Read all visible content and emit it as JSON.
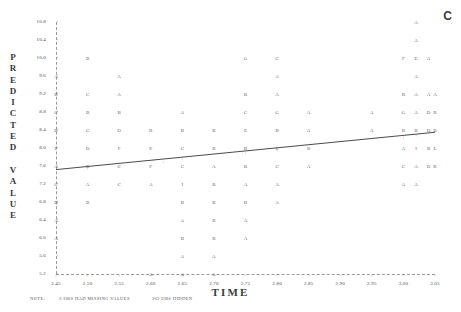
{
  "corner": {
    "label": "C"
  },
  "axes": {
    "y_title": "PREDICTED VALUE",
    "x_title": "TIME",
    "y_ticks": [
      "10.8",
      "10.4",
      "10.0",
      "9.6",
      "9.2",
      "8.8",
      "8.4",
      "8.0",
      "7.6",
      "7.2",
      "6.8",
      "6.4",
      "6.0",
      "5.6",
      "5.2"
    ],
    "x_ticks": [
      "2.45",
      "2.50",
      "2.55",
      "2.60",
      "2.65",
      "2.70",
      "2.75",
      "2.80",
      "2.85",
      "2.90",
      "2.95",
      "3.00",
      "3.05"
    ],
    "tick_mark": "+"
  },
  "note": {
    "label": "NOTE:",
    "text1": "6 OBS HAD MISSING VALUES",
    "text2": "363 OBS HIDDEN"
  },
  "chart_data": {
    "type": "scatter",
    "title": "",
    "xlabel": "TIME",
    "ylabel": "PREDICTED VALUE",
    "xlim": [
      2.45,
      3.05
    ],
    "ylim": [
      5.2,
      10.8
    ],
    "grid": false,
    "legend": "none",
    "marker_note": "letters A-F encode overplotted observation counts (A=1, B=2, C=3, D=4, E=5, F=6)",
    "points": [
      {
        "x": 2.5,
        "y": 10.0,
        "label": "B"
      },
      {
        "x": 2.45,
        "y": 9.6,
        "label": "A"
      },
      {
        "x": 2.55,
        "y": 9.6,
        "label": "A"
      },
      {
        "x": 2.45,
        "y": 9.2,
        "label": "B"
      },
      {
        "x": 2.5,
        "y": 9.2,
        "label": "C"
      },
      {
        "x": 2.55,
        "y": 9.2,
        "label": "A"
      },
      {
        "x": 2.45,
        "y": 8.8,
        "label": "C"
      },
      {
        "x": 2.5,
        "y": 8.8,
        "label": "B"
      },
      {
        "x": 2.55,
        "y": 8.8,
        "label": "B"
      },
      {
        "x": 2.45,
        "y": 8.4,
        "label": "B"
      },
      {
        "x": 2.5,
        "y": 8.4,
        "label": "C"
      },
      {
        "x": 2.55,
        "y": 8.4,
        "label": "D"
      },
      {
        "x": 2.45,
        "y": 8.0,
        "label": "F"
      },
      {
        "x": 2.5,
        "y": 8.0,
        "label": "D"
      },
      {
        "x": 2.55,
        "y": 8.0,
        "label": "F"
      },
      {
        "x": 2.45,
        "y": 7.6,
        "label": "A"
      },
      {
        "x": 2.5,
        "y": 7.6,
        "label": "B"
      },
      {
        "x": 2.55,
        "y": 7.6,
        "label": "C"
      },
      {
        "x": 2.45,
        "y": 7.2,
        "label": "C"
      },
      {
        "x": 2.5,
        "y": 7.2,
        "label": "A"
      },
      {
        "x": 2.55,
        "y": 7.2,
        "label": "C"
      },
      {
        "x": 2.45,
        "y": 6.8,
        "label": "D"
      },
      {
        "x": 2.5,
        "y": 6.8,
        "label": "B"
      },
      {
        "x": 2.45,
        "y": 6.4,
        "label": "A"
      },
      {
        "x": 2.45,
        "y": 6.0,
        "label": "A"
      },
      {
        "x": 2.6,
        "y": 8.4,
        "label": "B"
      },
      {
        "x": 2.65,
        "y": 8.4,
        "label": "B"
      },
      {
        "x": 2.7,
        "y": 8.4,
        "label": "B"
      },
      {
        "x": 2.65,
        "y": 8.8,
        "label": "A"
      },
      {
        "x": 2.6,
        "y": 8.0,
        "label": "E"
      },
      {
        "x": 2.65,
        "y": 8.0,
        "label": "C"
      },
      {
        "x": 2.7,
        "y": 8.0,
        "label": "B"
      },
      {
        "x": 2.6,
        "y": 7.6,
        "label": "F"
      },
      {
        "x": 2.65,
        "y": 7.6,
        "label": "C"
      },
      {
        "x": 2.7,
        "y": 7.6,
        "label": "A"
      },
      {
        "x": 2.6,
        "y": 7.2,
        "label": "A"
      },
      {
        "x": 2.65,
        "y": 7.2,
        "label": "I"
      },
      {
        "x": 2.7,
        "y": 7.2,
        "label": "B"
      },
      {
        "x": 2.65,
        "y": 6.8,
        "label": "B"
      },
      {
        "x": 2.7,
        "y": 6.8,
        "label": "B"
      },
      {
        "x": 2.65,
        "y": 6.4,
        "label": "A"
      },
      {
        "x": 2.7,
        "y": 6.4,
        "label": "B"
      },
      {
        "x": 2.65,
        "y": 6.0,
        "label": "B"
      },
      {
        "x": 2.7,
        "y": 6.0,
        "label": "B"
      },
      {
        "x": 2.65,
        "y": 5.6,
        "label": "A"
      },
      {
        "x": 2.7,
        "y": 5.6,
        "label": "A"
      },
      {
        "x": 2.6,
        "y": 5.2,
        "label": "A"
      },
      {
        "x": 2.65,
        "y": 5.2,
        "label": "A"
      },
      {
        "x": 2.7,
        "y": 5.2,
        "label": "A"
      },
      {
        "x": 2.75,
        "y": 10.0,
        "label": "G"
      },
      {
        "x": 2.75,
        "y": 9.2,
        "label": "B"
      },
      {
        "x": 2.75,
        "y": 8.8,
        "label": "C"
      },
      {
        "x": 2.75,
        "y": 8.4,
        "label": "E"
      },
      {
        "x": 2.75,
        "y": 8.0,
        "label": "B"
      },
      {
        "x": 2.75,
        "y": 7.6,
        "label": "B"
      },
      {
        "x": 2.75,
        "y": 7.2,
        "label": "A"
      },
      {
        "x": 2.75,
        "y": 6.8,
        "label": "B"
      },
      {
        "x": 2.75,
        "y": 6.4,
        "label": "A"
      },
      {
        "x": 2.75,
        "y": 6.0,
        "label": "A"
      },
      {
        "x": 2.8,
        "y": 10.0,
        "label": "C"
      },
      {
        "x": 2.8,
        "y": 9.6,
        "label": "A"
      },
      {
        "x": 2.8,
        "y": 9.2,
        "label": "A"
      },
      {
        "x": 2.8,
        "y": 8.8,
        "label": "G"
      },
      {
        "x": 2.8,
        "y": 8.4,
        "label": "B"
      },
      {
        "x": 2.8,
        "y": 8.0,
        "label": "E"
      },
      {
        "x": 2.8,
        "y": 7.6,
        "label": "C"
      },
      {
        "x": 2.8,
        "y": 7.2,
        "label": "A"
      },
      {
        "x": 2.8,
        "y": 6.8,
        "label": "A"
      },
      {
        "x": 2.85,
        "y": 8.8,
        "label": "A"
      },
      {
        "x": 2.85,
        "y": 8.4,
        "label": "A"
      },
      {
        "x": 2.85,
        "y": 8.0,
        "label": "B"
      },
      {
        "x": 2.85,
        "y": 7.6,
        "label": "A"
      },
      {
        "x": 2.95,
        "y": 8.8,
        "label": "A"
      },
      {
        "x": 2.95,
        "y": 8.4,
        "label": "A"
      },
      {
        "x": 3.0,
        "y": 10.0,
        "label": "F"
      },
      {
        "x": 3.0,
        "y": 9.2,
        "label": "B"
      },
      {
        "x": 3.0,
        "y": 8.8,
        "label": "G"
      },
      {
        "x": 3.0,
        "y": 8.4,
        "label": "B"
      },
      {
        "x": 3.0,
        "y": 8.0,
        "label": "A"
      },
      {
        "x": 3.0,
        "y": 7.6,
        "label": "C"
      },
      {
        "x": 3.0,
        "y": 7.2,
        "label": "A"
      },
      {
        "x": 3.02,
        "y": 10.8,
        "label": "A"
      },
      {
        "x": 3.02,
        "y": 10.4,
        "label": "A"
      },
      {
        "x": 3.02,
        "y": 10.0,
        "label": "E"
      },
      {
        "x": 3.02,
        "y": 9.6,
        "label": "A"
      },
      {
        "x": 3.02,
        "y": 9.2,
        "label": "A"
      },
      {
        "x": 3.02,
        "y": 8.8,
        "label": "A"
      },
      {
        "x": 3.02,
        "y": 8.4,
        "label": "B"
      },
      {
        "x": 3.02,
        "y": 8.0,
        "label": "I"
      },
      {
        "x": 3.02,
        "y": 7.6,
        "label": "A"
      },
      {
        "x": 3.02,
        "y": 7.2,
        "label": "A"
      },
      {
        "x": 3.04,
        "y": 10.0,
        "label": "A"
      },
      {
        "x": 3.04,
        "y": 9.2,
        "label": "A"
      },
      {
        "x": 3.04,
        "y": 8.8,
        "label": "D"
      },
      {
        "x": 3.04,
        "y": 8.4,
        "label": "D"
      },
      {
        "x": 3.04,
        "y": 8.0,
        "label": "B"
      },
      {
        "x": 3.04,
        "y": 7.6,
        "label": "D"
      },
      {
        "x": 3.05,
        "y": 9.2,
        "label": "A"
      },
      {
        "x": 3.05,
        "y": 8.8,
        "label": "B"
      },
      {
        "x": 3.05,
        "y": 8.4,
        "label": "B"
      },
      {
        "x": 3.05,
        "y": 8.0,
        "label": "L"
      },
      {
        "x": 3.05,
        "y": 7.6,
        "label": "B"
      }
    ],
    "plus_markers": [
      {
        "x": 2.5,
        "y": 7.55
      },
      {
        "x": 2.55,
        "y": 7.6
      },
      {
        "x": 2.62,
        "y": 7.7
      },
      {
        "x": 2.65,
        "y": 7.75
      },
      {
        "x": 2.75,
        "y": 7.9
      },
      {
        "x": 2.8,
        "y": 7.95
      },
      {
        "x": 3.0,
        "y": 8.25
      },
      {
        "x": 3.02,
        "y": 8.28
      }
    ],
    "fit_line": {
      "type": "linear",
      "x_start": 2.45,
      "y_start": 7.52,
      "x_end": 3.05,
      "y_end": 8.35,
      "color": "#4a4a4a"
    }
  }
}
